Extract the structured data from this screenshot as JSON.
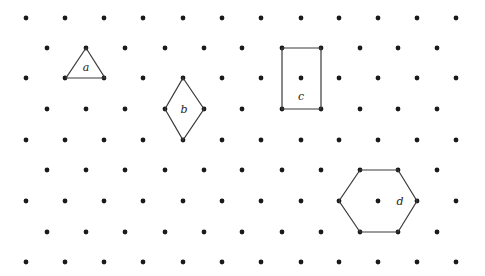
{
  "diagram": {
    "type": "isometric-dot-grid",
    "grid": {
      "rows_y": [
        18,
        48,
        78,
        109,
        140,
        170,
        201,
        232,
        262
      ],
      "even_row_x": [
        26,
        65,
        104,
        143,
        183,
        222,
        261,
        301,
        339,
        378,
        417,
        456
      ],
      "odd_row_x": [
        47,
        86,
        125,
        165,
        204,
        242,
        282,
        321,
        360,
        398,
        437
      ],
      "dot_radius": 2.4,
      "dot_color": "#1a1a1a"
    },
    "shapes": [
      {
        "id": "a",
        "kind": "triangle",
        "label": "a",
        "points": [
          [
            86,
            48
          ],
          [
            105,
            78
          ],
          [
            66,
            78
          ]
        ],
        "label_pos": [
          86,
          71
        ]
      },
      {
        "id": "b",
        "kind": "rhombus",
        "label": "b",
        "points": [
          [
            183,
            78
          ],
          [
            204,
            109
          ],
          [
            183,
            140
          ],
          [
            165,
            109
          ]
        ],
        "label_pos": [
          184,
          113
        ]
      },
      {
        "id": "c",
        "kind": "rectangle",
        "label": "c",
        "points": [
          [
            282,
            48
          ],
          [
            321,
            48
          ],
          [
            321,
            109
          ],
          [
            282,
            109
          ]
        ],
        "label_pos": [
          301,
          100
        ]
      },
      {
        "id": "d",
        "kind": "hexagon",
        "label": "d",
        "points": [
          [
            360,
            170
          ],
          [
            398,
            170
          ],
          [
            417,
            201
          ],
          [
            398,
            232
          ],
          [
            360,
            232
          ],
          [
            339,
            201
          ]
        ],
        "label_pos": [
          400,
          205
        ]
      }
    ],
    "stroke_color": "#3a3a3a"
  }
}
